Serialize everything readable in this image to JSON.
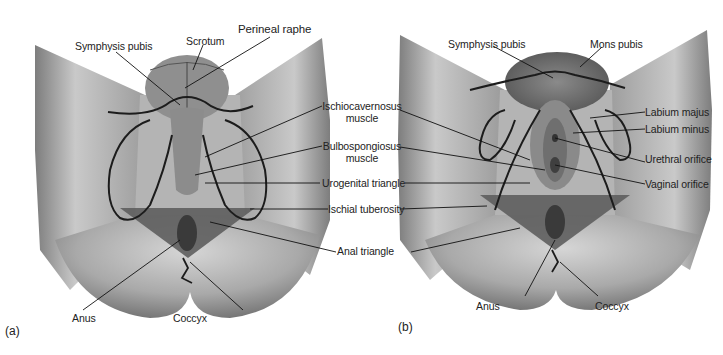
{
  "figure": {
    "panels": [
      {
        "id": "a",
        "tag": "(a)",
        "subject": "male perineum",
        "labels": {
          "symphysis_pubis": "Symphysis pubis",
          "scrotum": "Scrotum",
          "perineal_raphe": "Perineal raphe",
          "anus": "Anus",
          "coccyx": "Coccyx"
        }
      },
      {
        "id": "b",
        "tag": "(b)",
        "subject": "female perineum",
        "labels": {
          "symphysis_pubis": "Symphysis pubis",
          "mons_pubis": "Mons pubis",
          "labium_majus": "Labium majus",
          "labium_minus": "Labium minus",
          "urethral_orifice": "Urethral orifice",
          "vaginal_orifice": "Vaginal orifice",
          "anus": "Anus",
          "coccyx": "Coccyx"
        }
      }
    ],
    "shared_labels": {
      "ischiocavernosus_1": "Ischiocavernosus",
      "ischiocavernosus_2": "muscle",
      "bulbospongiosus_1": "Bulbospongiosus",
      "bulbospongiosus_2": "muscle",
      "urogenital_triangle": "Urogenital triangle",
      "ischial_tuberosity": "Ischial tuberosity",
      "anal_triangle": "Anal triangle"
    },
    "colors": {
      "skin_light": "#d9d9d9",
      "skin_mid": "#a8a8a8",
      "skin_dark": "#6e6e6e",
      "triangle_shade": "#5e5e5e",
      "outline": "#1c1c1c",
      "leader_line": "#111111"
    }
  }
}
